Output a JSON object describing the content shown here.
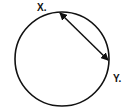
{
  "diagram": {
    "type": "circle-chord",
    "circle": {
      "cx": 62,
      "cy": 59,
      "r": 47,
      "stroke": "#111111"
    },
    "points": {
      "x": {
        "label": "X.",
        "px": 59,
        "py": 12
      },
      "y": {
        "label": "Y.",
        "px": 109,
        "py": 61
      }
    },
    "chord": {
      "from": "X",
      "to": "Y",
      "arrowheads": "both",
      "color": "#111111"
    }
  }
}
